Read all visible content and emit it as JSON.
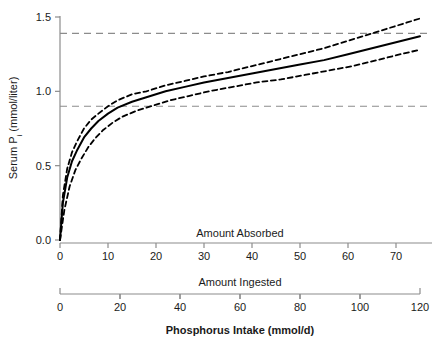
{
  "chart_data": {
    "type": "line",
    "title": "",
    "xlabel": "Phosphorus Intake (mmol/d)",
    "ylabel": "Serum P",
    "ylabel_sub": "i",
    "ylabel_units": " (mmol/liter)",
    "ylim": [
      0.0,
      1.5
    ],
    "yticks": [
      0.0,
      0.5,
      1.0,
      1.5
    ],
    "ytick_labels": [
      "0.0",
      "0.5",
      "1.0",
      "1.5"
    ],
    "grid": false,
    "legend_position": "none",
    "axes": [
      {
        "name": "absorbed",
        "label": "Amount Absorbed",
        "min": 0,
        "max": 75,
        "ticks": [
          0,
          10,
          20,
          30,
          40,
          50,
          60,
          70
        ],
        "tick_labels": [
          "0",
          "10",
          "20",
          "30",
          "40",
          "50",
          "60",
          "70"
        ],
        "end_caps": false
      },
      {
        "name": "ingested",
        "label": "Amount Ingested",
        "min": 0,
        "max": 120,
        "ticks": [
          0,
          20,
          40,
          60,
          80,
          100,
          120
        ],
        "tick_labels": [
          "0",
          "20",
          "40",
          "60",
          "80",
          "100",
          "120"
        ],
        "end_caps": true
      }
    ],
    "reference_lines": [
      {
        "name": "upper-reference-line",
        "y": 1.39,
        "style": "dashed",
        "color": "#8c8c8c"
      },
      {
        "name": "lower-reference-line",
        "y": 0.9,
        "style": "dashed",
        "color": "#8c8c8c"
      }
    ],
    "series": [
      {
        "name": "Fitted curve",
        "style": "solid",
        "color": "#000000",
        "x": [
          0,
          0.6,
          1.5,
          2.5,
          3.5,
          5,
          6.5,
          8,
          10,
          12,
          15,
          18,
          22,
          26,
          30,
          35,
          40,
          45,
          50,
          55,
          60,
          65,
          70,
          75
        ],
        "y": [
          0.0,
          0.25,
          0.42,
          0.53,
          0.6,
          0.69,
          0.75,
          0.8,
          0.85,
          0.89,
          0.93,
          0.96,
          1.0,
          1.03,
          1.06,
          1.09,
          1.12,
          1.15,
          1.18,
          1.21,
          1.25,
          1.29,
          1.33,
          1.37
        ]
      },
      {
        "name": "Upper 95% confidence band",
        "style": "dashed",
        "color": "#000000",
        "x": [
          0,
          0.6,
          1.5,
          2.5,
          3.5,
          5,
          6.5,
          8,
          10,
          12,
          15,
          18,
          22,
          26,
          30,
          35,
          40,
          45,
          50,
          55,
          60,
          65,
          70,
          75
        ],
        "y": [
          0.0,
          0.3,
          0.48,
          0.59,
          0.66,
          0.75,
          0.81,
          0.85,
          0.9,
          0.94,
          0.98,
          1.0,
          1.04,
          1.07,
          1.1,
          1.13,
          1.17,
          1.21,
          1.25,
          1.29,
          1.34,
          1.39,
          1.44,
          1.49
        ]
      },
      {
        "name": "Lower 95% confidence band",
        "style": "dashed",
        "color": "#000000",
        "x": [
          0,
          0.9,
          2.0,
          3.2,
          4.5,
          6,
          7.5,
          9,
          11,
          13,
          16,
          19,
          23,
          27,
          31,
          36,
          41,
          46,
          51,
          56,
          61,
          66,
          71,
          75
        ],
        "y": [
          0.0,
          0.2,
          0.36,
          0.47,
          0.55,
          0.63,
          0.69,
          0.74,
          0.79,
          0.83,
          0.87,
          0.9,
          0.94,
          0.97,
          1.0,
          1.03,
          1.06,
          1.08,
          1.11,
          1.14,
          1.17,
          1.21,
          1.25,
          1.28
        ]
      }
    ]
  }
}
